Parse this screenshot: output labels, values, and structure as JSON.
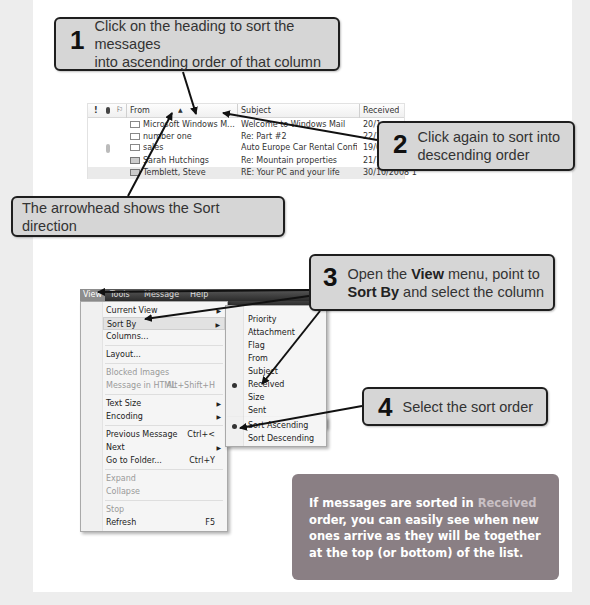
{
  "callouts": {
    "step1": {
      "number": "1",
      "text_line1": "Click on the heading to sort the messages",
      "text_line2": "into ascending order of that column"
    },
    "step2": {
      "number": "2",
      "text_line1": "Click again to sort into",
      "text_line2": "descending order"
    },
    "arrowhead_note": {
      "text": "The arrowhead shows the Sort direction"
    },
    "step3": {
      "number": "3",
      "text_pre": "Open the ",
      "bold1": "View",
      "text_mid": " menu, point to",
      "bold2": "Sort By",
      "text_post": " and select the column"
    },
    "step4": {
      "number": "4",
      "text": "Select the sort order"
    }
  },
  "mail_list": {
    "columns": {
      "priority": "!",
      "attachment": "⊘",
      "flag": "⚐",
      "from": "From",
      "sort_indicator": "▲",
      "subject": "Subject",
      "received": "Received"
    },
    "rows": [
      {
        "from": "Microsoft Windows M...",
        "subject": "Welcome to Windows Mail",
        "received": "20/1",
        "icon": "envelope-icon"
      },
      {
        "from": "number one",
        "subject": "Re: Part #2",
        "received": "22/1",
        "icon": "envelope-icon"
      },
      {
        "from": "sales",
        "subject": "Auto Europe Car Rental Confirmati...",
        "received": "19/0",
        "icon": "envelope-icon",
        "attachment": true
      },
      {
        "from": "Sarah Hutchings",
        "subject": "Re: Mountain properties",
        "received": "21/1",
        "icon": "open-envelope-icon"
      },
      {
        "from": "Temblett, Steve",
        "subject": "RE: Your PC and your life",
        "received": "30/10/2008 1",
        "icon": "open-envelope-icon"
      }
    ]
  },
  "menubar": {
    "items": [
      "View",
      "Tools",
      "Message",
      "Help"
    ],
    "active": "View"
  },
  "view_menu": {
    "items": [
      {
        "label": "Current View",
        "submenu": true
      },
      {
        "label": "Sort By",
        "submenu": true,
        "highlighted": true
      },
      {
        "label": "Columns..."
      },
      {
        "separator": true
      },
      {
        "label": "Layout..."
      },
      {
        "separator": true
      },
      {
        "label": "Blocked Images",
        "disabled": true
      },
      {
        "label": "Message in HTML",
        "shortcut": "Alt+Shift+H",
        "disabled": true
      },
      {
        "separator": true
      },
      {
        "label": "Text Size",
        "submenu": true
      },
      {
        "label": "Encoding",
        "submenu": true
      },
      {
        "separator": true
      },
      {
        "label": "Previous Message",
        "shortcut": "Ctrl+<"
      },
      {
        "label": "Next",
        "submenu": true
      },
      {
        "label": "Go to Folder...",
        "shortcut": "Ctrl+Y"
      },
      {
        "separator": true
      },
      {
        "label": "Expand",
        "disabled": true
      },
      {
        "label": "Collapse",
        "disabled": true
      },
      {
        "separator": true
      },
      {
        "label": "Stop",
        "disabled": true
      },
      {
        "label": "Refresh",
        "shortcut": "F5"
      }
    ]
  },
  "sort_by_submenu": {
    "items": [
      {
        "label": "Priority"
      },
      {
        "label": "Attachment"
      },
      {
        "label": "Flag"
      },
      {
        "label": "From"
      },
      {
        "label": "Subject"
      },
      {
        "label": "Received",
        "selected": true
      },
      {
        "label": "Size"
      },
      {
        "label": "Sent"
      },
      {
        "separator": true
      },
      {
        "label": "Sort Ascending",
        "selected": true
      },
      {
        "label": "Sort Descending"
      }
    ]
  },
  "tip": {
    "text_pre": "If messages are sorted in ",
    "highlight": "Received",
    "text_post": " order, you can easily see when new ones arrive as they will be together at the top (or bottom) of the list."
  },
  "colors": {
    "page_bg": "#ededed",
    "panel_bg": "#ffffff",
    "callout_bg": "#d6d6d6",
    "callout_border": "#1e1e1e",
    "tip_bg": "#8a7f84",
    "tip_highlight": "#c9c0c4"
  }
}
